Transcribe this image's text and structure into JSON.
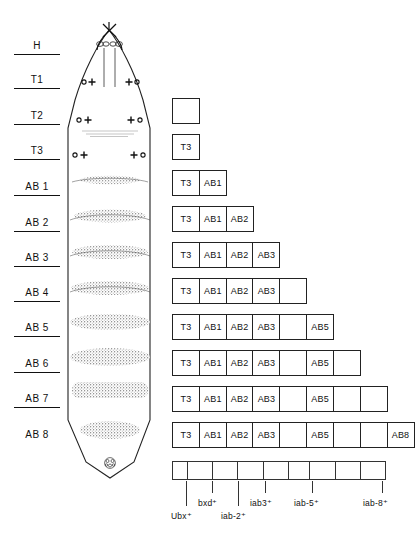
{
  "figure": {
    "type": "biology-diagram"
  },
  "segment_labels": [
    {
      "id": "H",
      "label": "H",
      "y": 46,
      "rule": true
    },
    {
      "id": "T1",
      "label": "T1",
      "y": 80,
      "rule": true
    },
    {
      "id": "T2",
      "label": "T2",
      "y": 116,
      "rule": true
    },
    {
      "id": "T3",
      "label": "T3",
      "y": 151,
      "rule": true
    },
    {
      "id": "AB1",
      "label": "AB 1",
      "y": 187,
      "rule": true
    },
    {
      "id": "AB2",
      "label": "AB 2",
      "y": 223,
      "rule": true
    },
    {
      "id": "AB3",
      "label": "AB 3",
      "y": 258,
      "rule": true
    },
    {
      "id": "AB4",
      "label": "AB 4",
      "y": 293,
      "rule": true
    },
    {
      "id": "AB5",
      "label": "AB 5",
      "y": 328,
      "rule": true
    },
    {
      "id": "AB6",
      "label": "AB 6",
      "y": 364,
      "rule": true
    },
    {
      "id": "AB7",
      "label": "AB 7",
      "y": 399,
      "rule": true
    },
    {
      "id": "AB8",
      "label": "AB 8",
      "y": 435,
      "rule": false
    }
  ],
  "box_rows": [
    {
      "row": 1,
      "y": 98,
      "cells": [
        "",
        "",
        "",
        "",
        "",
        "",
        "",
        "",
        ""
      ],
      "visible": 1
    },
    {
      "row": 2,
      "y": 134,
      "cells": [
        "T3"
      ],
      "visible": 1
    },
    {
      "row": 3,
      "y": 170,
      "cells": [
        "T3",
        "AB1"
      ],
      "visible": 2
    },
    {
      "row": 4,
      "y": 206,
      "cells": [
        "T3",
        "AB1",
        "AB2"
      ],
      "visible": 3
    },
    {
      "row": 5,
      "y": 242,
      "cells": [
        "T3",
        "AB1",
        "AB2",
        "AB3"
      ],
      "visible": 4
    },
    {
      "row": 6,
      "y": 278,
      "cells": [
        "T3",
        "AB1",
        "AB2",
        "AB3",
        ""
      ],
      "visible": 5
    },
    {
      "row": 7,
      "y": 314,
      "cells": [
        "T3",
        "AB1",
        "AB2",
        "AB3",
        "",
        "AB5"
      ],
      "visible": 6
    },
    {
      "row": 8,
      "y": 350,
      "cells": [
        "T3",
        "AB1",
        "AB2",
        "AB3",
        "",
        "AB5",
        ""
      ],
      "visible": 7
    },
    {
      "row": 9,
      "y": 386,
      "cells": [
        "T3",
        "AB1",
        "AB2",
        "AB3",
        "",
        "AB5",
        "",
        ""
      ],
      "visible": 8
    },
    {
      "row": 10,
      "y": 422,
      "cells": [
        "T3",
        "AB1",
        "AB2",
        "AB3",
        "",
        "AB5",
        "",
        "",
        "AB8"
      ],
      "visible": 9
    }
  ],
  "gene_bar": {
    "cell_count": 9,
    "labels": [
      {
        "name": "Ubx⁺",
        "tick_x": 186,
        "label_x": 171,
        "label_y": 511,
        "tick_y": 481,
        "tick_h": 25
      },
      {
        "name": "bxd⁺",
        "tick_x": 212,
        "label_x": 198,
        "label_y": 498,
        "tick_y": 481,
        "tick_h": 12
      },
      {
        "name": "iab-2⁺",
        "tick_x": 238,
        "label_x": 221,
        "label_y": 511,
        "tick_y": 481,
        "tick_h": 25
      },
      {
        "name": "iab3⁺",
        "tick_x": 265,
        "label_x": 250,
        "label_y": 498,
        "tick_y": 481,
        "tick_h": 12
      },
      {
        "name": "iab-5⁺",
        "tick_x": 312,
        "label_x": 294,
        "label_y": 498,
        "tick_y": 481,
        "tick_h": 12
      },
      {
        "name": "iab-8⁺",
        "tick_x": 382,
        "label_x": 363,
        "label_y": 498,
        "tick_y": 481,
        "tick_h": 12
      }
    ]
  },
  "larva": {
    "sense_organs_rows": [
      {
        "y": 82,
        "marks": "o + | + o"
      },
      {
        "y": 120,
        "marks": "o +   + o"
      },
      {
        "y": 155,
        "marks": "o +   + o"
      }
    ],
    "denticle_belts": [
      {
        "segment": "T3",
        "y": 180
      },
      {
        "segment": "AB1",
        "y": 216
      },
      {
        "segment": "AB2",
        "y": 252
      },
      {
        "segment": "AB3",
        "y": 288
      },
      {
        "segment": "AB4",
        "y": 322
      },
      {
        "segment": "AB5",
        "y": 357
      },
      {
        "segment": "AB6",
        "y": 390
      },
      {
        "segment": "AB7",
        "y": 430
      }
    ]
  },
  "colors": {
    "ink": "#111111",
    "line": "#222222",
    "background": "#ffffff"
  }
}
